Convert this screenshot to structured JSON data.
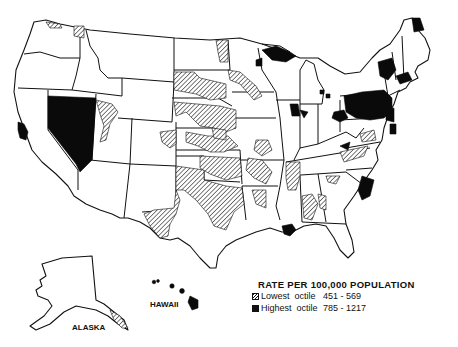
{
  "map": {
    "type": "choropleth",
    "region": "United States",
    "colors": {
      "highest": "#0a0a0a",
      "lowest_pattern": "diagonal-hatch",
      "outline": "#111111",
      "background": "#ffffff"
    },
    "insets": [
      {
        "id": "alaska",
        "label": "ALASKA"
      },
      {
        "id": "hawaii",
        "label": "HAWAII"
      }
    ]
  },
  "legend": {
    "title": "RATE PER 100,000 POPULATION",
    "entries": [
      {
        "symbol": "hatched-swatch",
        "label": "Lowest  octile",
        "range": "451 - 569"
      },
      {
        "symbol": "solid-black-swatch",
        "label": "Highest  octile",
        "range": "785 - 1217"
      }
    ]
  },
  "highlighted_areas": {
    "highest_octile": [
      "Nevada",
      "Northern California coast",
      "Upper Michigan",
      "Northern Wisconsin",
      "Northern Maine",
      "New York / Vermont",
      "Pennsylvania",
      "New Jersey",
      "Massachusetts / Connecticut",
      "Ohio",
      "Indiana/Illinois border",
      "South Carolina coast",
      "Louisiana delta",
      "Hawaii"
    ],
    "lowest_octile": [
      "Texas",
      "Oklahoma",
      "Kansas",
      "Nebraska",
      "North Dakota",
      "Minnesota",
      "Iowa",
      "Arkansas",
      "Mississippi",
      "Alabama",
      "Tennessee",
      "Virginia",
      "Utah",
      "Idaho/Washington border",
      "Southeast Alaska"
    ]
  }
}
